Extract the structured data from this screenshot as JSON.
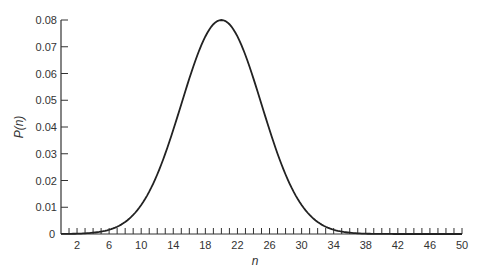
{
  "chart_data": {
    "type": "line",
    "title": "",
    "xlabel": "n",
    "ylabel": "P(n)",
    "xlim": [
      0,
      50
    ],
    "ylim": [
      0,
      0.08
    ],
    "grid": false,
    "legend": null,
    "x_tick_labels": [
      2,
      6,
      10,
      14,
      18,
      22,
      26,
      30,
      34,
      38,
      42,
      46,
      50
    ],
    "x_minor_tick_step": 1,
    "y_tick_labels": [
      "0",
      "0.01",
      "0.02",
      "0.03",
      "0.04",
      "0.05",
      "0.06",
      "0.07",
      "0.08"
    ],
    "y_tick_values": [
      0,
      0.01,
      0.02,
      0.03,
      0.04,
      0.05,
      0.06,
      0.07,
      0.08
    ],
    "curve": {
      "description": "Bell-shaped probability distribution centered at n=20",
      "mean": 20,
      "std": 5,
      "peak": 0.08
    },
    "series": [
      {
        "name": "P(n)",
        "x": [
          0,
          2,
          4,
          6,
          8,
          10,
          12,
          14,
          16,
          18,
          20,
          22,
          24,
          26,
          28,
          30,
          32,
          34,
          36,
          38,
          40,
          42,
          44,
          46,
          48,
          50
        ],
        "values": [
          0.0003,
          0.0012,
          0.0036,
          0.0089,
          0.0194,
          0.0108,
          0.0222,
          0.0389,
          0.0579,
          0.0737,
          0.0798,
          0.0737,
          0.0579,
          0.0389,
          0.0222,
          0.0108,
          0.0045,
          0.0016,
          0.0005,
          0.0002,
          0.0,
          0.0,
          0.0,
          0.0,
          0.0,
          0.0
        ]
      }
    ]
  }
}
